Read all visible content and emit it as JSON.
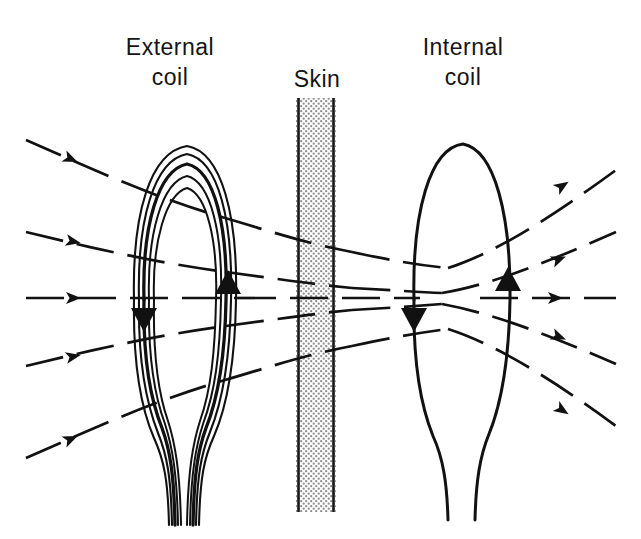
{
  "figure": {
    "title_visible": false,
    "background_color": "#ffffff",
    "ink_color": "#111111",
    "labels": {
      "external_coil": "External\ncoil",
      "skin": "Skin",
      "internal_coil": "Internal\ncoil"
    },
    "skin_layer": {
      "name": "skin",
      "fill_pattern": "stipple-dots",
      "fill_color": "#9a9a9a",
      "border_color": "#1a1a1a",
      "x_left": 296,
      "x_right": 336,
      "y_top": 98,
      "y_bottom": 512,
      "width_px": 40
    },
    "external_coil": {
      "name": "external-coil",
      "turns": 5,
      "style": "multi-turn-wound",
      "center_x": 185,
      "top_y": 140,
      "bottom_y": 455,
      "half_width": 62,
      "lead_bottom_y": 525,
      "current_arrow_left": "down",
      "current_arrow_right": "up",
      "stroke_color": "#111111"
    },
    "internal_coil": {
      "name": "internal-coil",
      "turns": 1,
      "style": "single-line",
      "center_x": 462,
      "top_y": 143,
      "bottom_y": 455,
      "half_width": 48,
      "lead_bottom_y": 520,
      "current_arrow_left": "down",
      "current_arrow_right": "up",
      "stroke_color": "#111111"
    },
    "field_lines": {
      "name": "magnetic-flux-lines",
      "count_left": 5,
      "count_right": 5,
      "dash_pattern": "38 14",
      "arrow_direction": "right",
      "stroke_color": "#111111",
      "rows_y": [
        162,
        228,
        298,
        368,
        436
      ]
    }
  }
}
